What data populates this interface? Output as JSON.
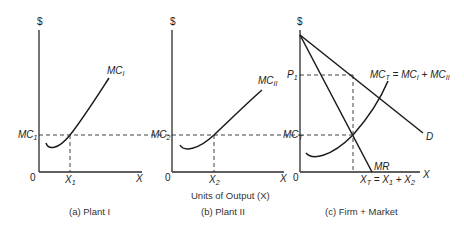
{
  "figure": {
    "axis_label_shared": "Units of Output (X)",
    "panels": [
      {
        "id": "a",
        "caption": "(a) Plant I",
        "y_axis_label": "$",
        "x_axis_label": "X",
        "origin_label": "0",
        "curve_label": "MC",
        "curve_label_sub": "I",
        "price_level_label": "MC",
        "price_level_sub": "1",
        "quantity_label": "X",
        "quantity_sub": "1"
      },
      {
        "id": "b",
        "caption": "(b) Plant II",
        "y_axis_label": "$",
        "x_axis_label": "X",
        "origin_label": "0",
        "curve_label": "MC",
        "curve_label_sub": "II",
        "price_level_label": "MC",
        "price_level_sub": "2",
        "quantity_label": "X",
        "quantity_sub": "2"
      },
      {
        "id": "c",
        "caption": "(c) Firm + Market",
        "y_axis_label": "$",
        "x_axis_label": "X",
        "origin_label": "0",
        "price_label": "P",
        "price_sub": "1",
        "mc_level_label": "MC",
        "mc_level_sub": "T",
        "total_mc_label": "MC",
        "total_mc_sub": "T",
        "total_mc_eq": " = MC",
        "total_mc_eq_sub1": "I",
        "total_mc_plus": " + MC",
        "total_mc_eq_sub2": "II",
        "demand_label": "D",
        "mr_label": "MR",
        "quantity_label": "X",
        "quantity_sub": "T",
        "quantity_eq": " = X",
        "quantity_eq_sub1": "1",
        "quantity_plus": " + X",
        "quantity_eq_sub2": "2"
      }
    ]
  }
}
